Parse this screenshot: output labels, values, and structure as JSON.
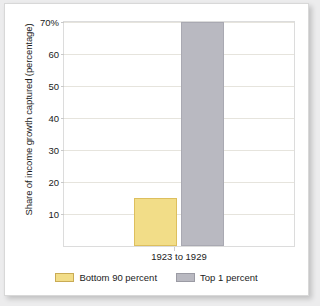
{
  "chart_data": {
    "type": "bar",
    "title": "",
    "xlabel": "",
    "ylabel": "Share of income growth captured (percentage)",
    "categories": [
      "1923 to 1929"
    ],
    "series": [
      {
        "name": "Bottom 90 percent",
        "values": [
          15
        ],
        "color": "#f2dd88"
      },
      {
        "name": "Top 1 percent",
        "values": [
          70
        ],
        "color": "#b9b9c1"
      }
    ],
    "ylim": [
      0,
      70
    ],
    "yticks": [
      10,
      20,
      30,
      40,
      50,
      60,
      70
    ],
    "ytick_labels": [
      "10",
      "20",
      "30",
      "40",
      "50",
      "60",
      "70%"
    ],
    "grid": "horizontal",
    "legend_position": "bottom"
  },
  "axes": {
    "y_title": "Share of income growth captured (percentage)",
    "ticks": [
      {
        "value": 70,
        "label": "70%"
      },
      {
        "value": 60,
        "label": "60"
      },
      {
        "value": 50,
        "label": "50"
      },
      {
        "value": 40,
        "label": "40"
      },
      {
        "value": 30,
        "label": "30"
      },
      {
        "value": 20,
        "label": "20"
      },
      {
        "value": 10,
        "label": "10"
      }
    ],
    "x_category": "1923 to 1929"
  },
  "legend": {
    "items": [
      {
        "label": "Bottom 90 percent",
        "color": "#f2dd88"
      },
      {
        "label": "Top 1 percent",
        "color": "#b9b9c1"
      }
    ]
  }
}
